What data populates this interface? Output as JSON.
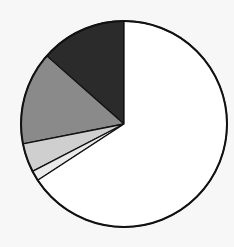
{
  "chart_data": {
    "type": "pie",
    "title": "",
    "start_angle_deg": 0,
    "direction": "counterclockwise",
    "slices": [
      {
        "name": "slice-1",
        "value": 13.5,
        "color": "#2b2b2b"
      },
      {
        "name": "slice-2",
        "value": 14.6,
        "color": "#8a8a8a"
      },
      {
        "name": "slice-3",
        "value": 4.5,
        "color": "#cfcfcf"
      },
      {
        "name": "slice-4",
        "value": 1.6,
        "color": "#eaeaea"
      },
      {
        "name": "slice-5",
        "value": 65.8,
        "color": "#ffffff"
      }
    ],
    "legend": [],
    "labels_shown": false
  },
  "style": {
    "background": "#f7f7f7",
    "outline": "#111111",
    "center": [
      124,
      124
    ],
    "radius": 103
  }
}
